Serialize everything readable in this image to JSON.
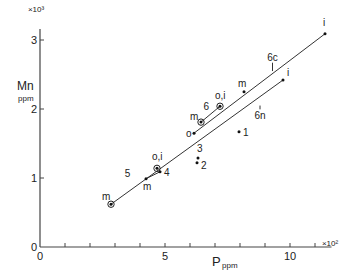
{
  "chart_data": {
    "type": "scatter",
    "title": "",
    "xlabel": "P",
    "xlabel_sub": "ppm",
    "ylabel": "Mn",
    "ylabel_sub": "ppm",
    "x_multiplier": "×10²",
    "y_multiplier": "×10³",
    "xlim": [
      0,
      11.5
    ],
    "ylim": [
      0,
      3.1
    ],
    "x_ticks": [
      0,
      1,
      2,
      3,
      4,
      5,
      6,
      7,
      8,
      9,
      10,
      11
    ],
    "x_tick_labels": {
      "0": "0",
      "5": "5",
      "10": "10"
    },
    "y_ticks": [
      0,
      1,
      2,
      3
    ],
    "y_tick_labels": {
      "0": "0",
      "1": "1",
      "2": "2",
      "3": "3"
    },
    "grid": false,
    "points": [
      {
        "id": "m-start",
        "x": 2.84,
        "y": 0.62,
        "label": "m",
        "circled": true
      },
      {
        "id": "m-5",
        "x": 4.24,
        "y": 0.99,
        "label": "m",
        "circled": false
      },
      {
        "id": "oi-5",
        "x": 4.68,
        "y": 1.14,
        "label": "o,i",
        "circled": true
      },
      {
        "id": "p4",
        "x": 4.8,
        "y": 1.09,
        "label": "4",
        "circled": false
      },
      {
        "id": "p3",
        "x": 6.32,
        "y": 1.29,
        "label": "3",
        "circled": false
      },
      {
        "id": "p2",
        "x": 6.28,
        "y": 1.22,
        "label": "2",
        "circled": false
      },
      {
        "id": "o-6",
        "x": 6.16,
        "y": 1.65,
        "label": "o",
        "circled": false
      },
      {
        "id": "m-6",
        "x": 6.44,
        "y": 1.81,
        "label": "m",
        "circled": true
      },
      {
        "id": "oi-6",
        "x": 7.2,
        "y": 2.04,
        "label": "o,i",
        "circled": true
      },
      {
        "id": "p1",
        "x": 7.96,
        "y": 1.67,
        "label": "1",
        "circled": false
      },
      {
        "id": "m-6c",
        "x": 8.16,
        "y": 2.25,
        "label": "m",
        "circled": false
      },
      {
        "id": "i-6n",
        "x": 9.72,
        "y": 2.42,
        "label": "i",
        "circled": false
      },
      {
        "id": "i-6c",
        "x": 11.4,
        "y": 3.09,
        "label": "i",
        "circled": false
      }
    ],
    "lines": [
      {
        "name": "6c",
        "from": [
          6.16,
          1.65
        ],
        "to": [
          11.4,
          3.09
        ]
      },
      {
        "name": "6n",
        "from": [
          2.84,
          0.62
        ],
        "to": [
          9.72,
          2.42
        ]
      },
      {
        "name": "6",
        "from": [
          6.44,
          1.81
        ],
        "to": [
          7.2,
          2.04
        ]
      },
      {
        "name": "5-segment",
        "from": [
          4.24,
          0.99
        ],
        "to": [
          4.8,
          1.09
        ]
      }
    ],
    "annotations": [
      {
        "text": "5",
        "x": 3.5,
        "y": 1.02
      },
      {
        "text": "6",
        "x": 6.65,
        "y": 1.98
      },
      {
        "text": "6c",
        "x": 9.3,
        "y": 2.7,
        "arrow_to": [
          9.3,
          2.55
        ]
      },
      {
        "text": "6n",
        "x": 8.8,
        "y": 1.85,
        "arrow_to": [
          8.8,
          2.05
        ]
      }
    ]
  }
}
